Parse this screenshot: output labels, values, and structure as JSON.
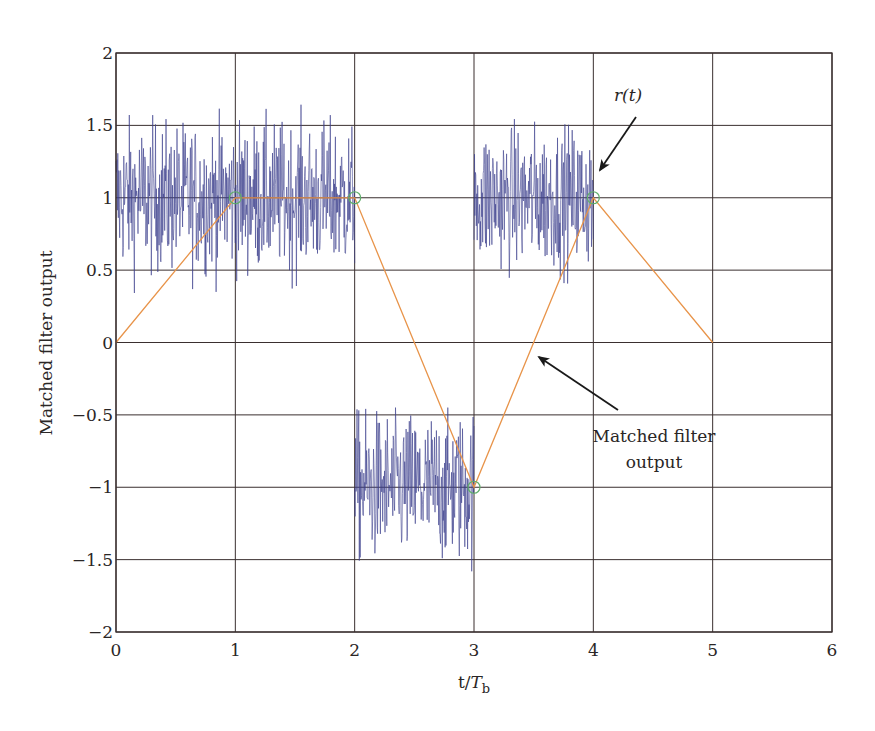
{
  "chart_data": {
    "type": "line",
    "title": "",
    "xlabel": "t/T_b",
    "xlabel_main": "t/",
    "xlabel_italic": "T",
    "xlabel_sub": "b",
    "ylabel": "Matched filter output",
    "xlim": [
      0,
      6
    ],
    "ylim": [
      -2,
      2
    ],
    "xticks": [
      0,
      1,
      2,
      3,
      4,
      5,
      6
    ],
    "xtick_labels": [
      "0",
      "1",
      "2",
      "3",
      "4",
      "5",
      "6"
    ],
    "yticks": [
      2,
      1.5,
      1,
      0.5,
      0,
      -0.5,
      -1,
      -1.5,
      -2
    ],
    "ytick_labels": [
      "2",
      "1.5",
      "1",
      "0.5",
      "0",
      "−0.5",
      "−1",
      "−1.5",
      "−2"
    ],
    "grid": true,
    "legend": null,
    "series": [
      {
        "name": "r(t)",
        "style": "noisy received signal",
        "color": "#3b3f8c",
        "segments": [
          {
            "x_start": 0,
            "x_end": 2,
            "level": 1,
            "noise_min": 0.25,
            "noise_max": 1.75
          },
          {
            "x_start": 2,
            "x_end": 3,
            "level": -1,
            "noise_min": -1.95,
            "noise_max": -0.45
          },
          {
            "x_start": 3,
            "x_end": 4,
            "level": 1,
            "noise_min": 0.3,
            "noise_max": 1.72
          }
        ]
      },
      {
        "name": "Matched filter output",
        "color": "#e8944a",
        "x": [
          0,
          1,
          2,
          3,
          4,
          5
        ],
        "values": [
          0,
          1,
          1,
          -1,
          1,
          0
        ]
      },
      {
        "name": "Sample points",
        "marker": "circle",
        "color": "#5fae6a",
        "x": [
          1,
          2,
          3,
          4
        ],
        "values": [
          1,
          1,
          -1,
          1
        ]
      }
    ],
    "annotations": [
      {
        "text": "r(t)",
        "italic": true,
        "arrow_to": [
          4.0,
          1.15
        ]
      },
      {
        "text_lines": [
          "Matched filter",
          "output"
        ],
        "arrow_to": [
          3.55,
          -0.1
        ]
      }
    ]
  },
  "colors": {
    "grid": "#3a2f2f",
    "frame": "#3a2f2f",
    "noise": "#3b3f8c",
    "mf_line": "#e8944a",
    "marker": "#5fae6a",
    "arrow": "#1a1a1a"
  }
}
